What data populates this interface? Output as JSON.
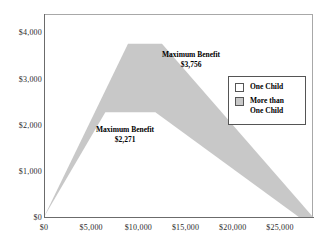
{
  "chart_data": {
    "type": "area",
    "title": "",
    "xlabel": "",
    "ylabel": "",
    "xlim": [
      0,
      28500
    ],
    "ylim": [
      0,
      4400
    ],
    "grid": false,
    "legend_position": "right",
    "x_ticks": [
      "$0",
      "$5,000",
      "$10,000",
      "$15,000",
      "$20,000",
      "$25,000"
    ],
    "x_tick_values": [
      0,
      5000,
      10000,
      15000,
      20000,
      25000
    ],
    "y_ticks": [
      "$0",
      "$1,000",
      "$2,000",
      "$3,000",
      "$4,000"
    ],
    "y_tick_values": [
      0,
      1000,
      2000,
      3000,
      4000
    ],
    "series": [
      {
        "name": "One Child",
        "color": "#ffffff",
        "max_benefit": 2271,
        "x": [
          0,
          6500,
          11800,
          27000
        ],
        "values": [
          0,
          2271,
          2271,
          0
        ]
      },
      {
        "name": "More than One Child",
        "color": "#c8c8c8",
        "max_benefit": 3756,
        "x": [
          0,
          8900,
          12500,
          28500
        ],
        "values": [
          0,
          3756,
          3756,
          0
        ]
      }
    ],
    "annotations": [
      {
        "id": "upper",
        "title": "Maximum Benefit",
        "value": "$3,756",
        "series": "More than One Child"
      },
      {
        "id": "lower",
        "title": "Maximum Benefit",
        "value": "$2,271",
        "series": "One Child"
      }
    ]
  },
  "legend": {
    "items": [
      {
        "label": "One Child",
        "swatch": "#ffffff"
      },
      {
        "label": "More than\nOne Child",
        "swatch": "#c8c8c8"
      }
    ]
  }
}
